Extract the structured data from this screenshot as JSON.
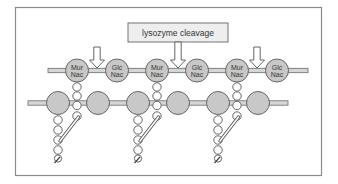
{
  "diagram": {
    "label": "lysozyme cleavage",
    "top_chain": {
      "sugars": [
        {
          "line1": "Mur",
          "line2": "Nac",
          "type": "MurNac"
        },
        {
          "line1": "Glc",
          "line2": "Nac",
          "type": "GlcNac"
        },
        {
          "line1": "Mur",
          "line2": "Nac",
          "type": "MurNac"
        },
        {
          "line1": "Glc",
          "line2": "Nac",
          "type": "GlcNac"
        },
        {
          "line1": "Mur",
          "line2": "Nac",
          "type": "MurNac"
        },
        {
          "line1": "Glc",
          "line2": "Nac",
          "type": "GlcNac"
        }
      ],
      "cleavage_sites": 3
    },
    "bottom_chain": {
      "sugar_count": 6,
      "unlabeled": true
    },
    "peptide_crosslinks": 3,
    "colors": {
      "sugar_fill": "#c8c8c8",
      "bead_fill": "#ffffff",
      "label_box_fill": "#eeeeee",
      "outline": "#555555"
    }
  }
}
